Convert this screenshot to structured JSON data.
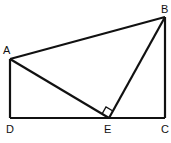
{
  "diagram": {
    "type": "geometry",
    "stroke_color": "#111111",
    "background": "#ffffff",
    "points": {
      "A": {
        "label": "A",
        "x": 10,
        "y": 59
      },
      "B": {
        "label": "B",
        "x": 165,
        "y": 17
      },
      "C": {
        "label": "C",
        "x": 165,
        "y": 118
      },
      "D": {
        "label": "D",
        "x": 10,
        "y": 118
      },
      "E": {
        "label": "E",
        "x": 109,
        "y": 118
      }
    },
    "segments": [
      {
        "from": "A",
        "to": "B"
      },
      {
        "from": "B",
        "to": "C"
      },
      {
        "from": "C",
        "to": "D"
      },
      {
        "from": "D",
        "to": "A"
      },
      {
        "from": "A",
        "to": "E"
      },
      {
        "from": "E",
        "to": "B"
      }
    ],
    "right_angle_marker": {
      "at": "E",
      "between": [
        "A",
        "B"
      ]
    },
    "labels": {
      "A": "A",
      "B": "B",
      "C": "C",
      "D": "D",
      "E": "E"
    }
  }
}
